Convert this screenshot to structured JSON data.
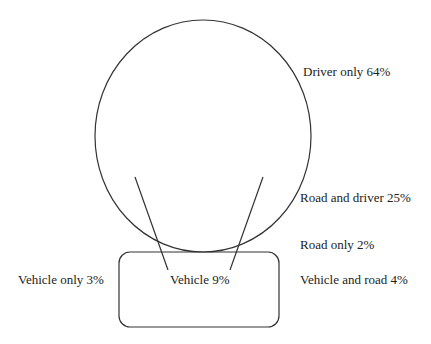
{
  "diagram": {
    "type": "venn",
    "sets": [
      {
        "name": "Driver",
        "shape": "circle"
      },
      {
        "name": "Vehicle",
        "shape": "rounded-rectangle"
      }
    ],
    "labels": {
      "driver_only": "Driver only 64%",
      "road_and_driver": "Road and driver 25%",
      "road_only": "Road only 2%",
      "vehicle_only": "Vehicle only 3%",
      "vehicle": "Vehicle 9%",
      "vehicle_and_road": "Vehicle and road 4%"
    },
    "values": {
      "driver_only": 64,
      "road_and_driver": 25,
      "road_only": 2,
      "vehicle_only": 3,
      "vehicle": 9,
      "vehicle_and_road": 4
    },
    "colors": {
      "stroke": "#333333",
      "text": "#222222",
      "background": "#ffffff"
    }
  }
}
